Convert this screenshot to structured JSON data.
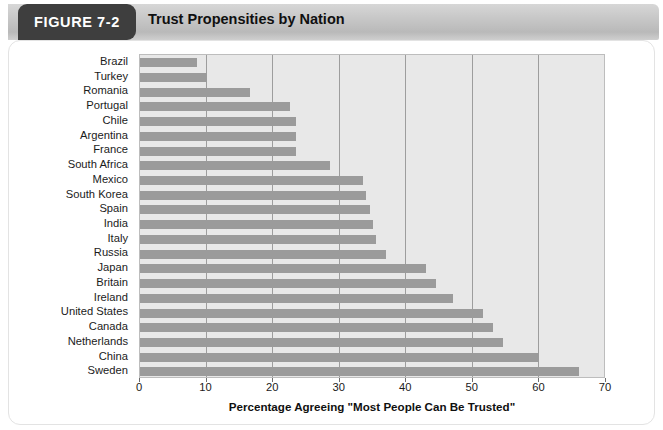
{
  "header": {
    "figure_tab_label": "FIGURE 7-2",
    "title": "Trust Propensities by Nation",
    "tab_bg": "#3e3e3e",
    "band_bg": "#c9c9c9"
  },
  "colors": {
    "bar": "#9b9b9b",
    "plot_background": "#e8e8e8",
    "gridline": "#9d9d9d",
    "panel_border": "#e3e3e3",
    "text": "#1b1b1b"
  },
  "chart_data": {
    "type": "bar",
    "orientation": "horizontal",
    "title": "Trust Propensities by Nation",
    "xlabel": "Percentage Agreeing \"Most People Can Be Trusted\"",
    "ylabel": "",
    "xlim": [
      0,
      70
    ],
    "xticks": [
      0,
      10,
      20,
      30,
      40,
      50,
      60,
      70
    ],
    "grid": true,
    "legend": false,
    "categories": [
      "Brazil",
      "Turkey",
      "Romania",
      "Portugal",
      "Chile",
      "Argentina",
      "France",
      "South Africa",
      "Mexico",
      "South Korea",
      "Spain",
      "India",
      "Italy",
      "Russia",
      "Japan",
      "Britain",
      "Ireland",
      "United States",
      "Canada",
      "Netherlands",
      "China",
      "Sweden"
    ],
    "values": [
      8.5,
      10,
      16.5,
      22.5,
      23.5,
      23.5,
      23.5,
      28.5,
      33.5,
      34,
      34.5,
      35,
      35.5,
      37,
      43,
      44.5,
      47,
      51.5,
      53,
      54.5,
      60,
      66
    ]
  }
}
